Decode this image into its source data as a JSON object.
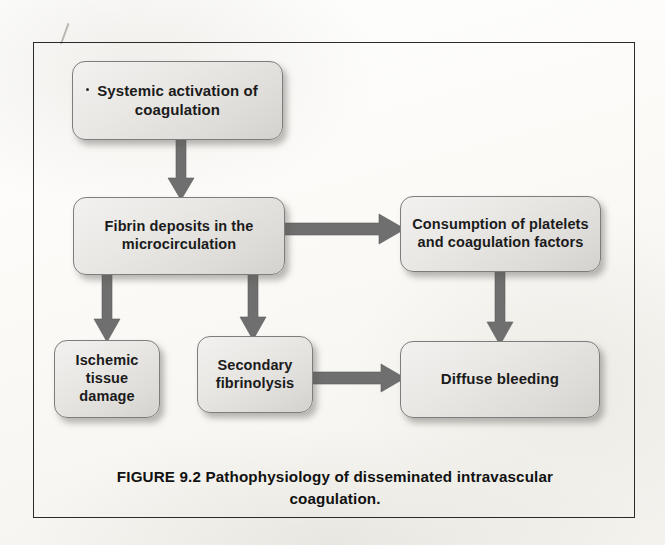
{
  "figure": {
    "caption_line1": "FIGURE 9.2  Pathophysiology of disseminated intravascular",
    "caption_line2": "coagulation.",
    "caption_full": "FIGURE 9.2  Pathophysiology of disseminated intravascular coagulation.",
    "frame_color": "#2a2a2a",
    "page_background": "#fdfdfb"
  },
  "diagram": {
    "type": "flowchart",
    "node_fill_color": "#e6e4e0",
    "node_border_color": "#7d7d7d",
    "arrow_color": "#6f6f6f",
    "text_color": "#1b1b1b",
    "nodes": [
      {
        "id": "systemic",
        "label": "Systemic activation of\ncoagulation",
        "font_size": 15
      },
      {
        "id": "fibrin",
        "label": "Fibrin deposits in the\nmicrocirculation",
        "font_size": 14.5
      },
      {
        "id": "consumption",
        "label": "Consumption of platelets\nand coagulation factors",
        "font_size": 14.5
      },
      {
        "id": "ischemic",
        "label": "Ischemic\ntissue\ndamage",
        "font_size": 14.5
      },
      {
        "id": "secondary",
        "label": "Secondary\nfibrinolysis",
        "font_size": 14.5
      },
      {
        "id": "diffuse",
        "label": "Diffuse bleeding",
        "font_size": 15
      }
    ],
    "edges": [
      {
        "from": "systemic",
        "to": "fibrin",
        "direction": "down"
      },
      {
        "from": "fibrin",
        "to": "consumption",
        "direction": "right"
      },
      {
        "from": "fibrin",
        "to": "ischemic",
        "direction": "down"
      },
      {
        "from": "fibrin",
        "to": "secondary",
        "direction": "down"
      },
      {
        "from": "consumption",
        "to": "diffuse",
        "direction": "down"
      },
      {
        "from": "secondary",
        "to": "diffuse",
        "direction": "right"
      }
    ]
  }
}
